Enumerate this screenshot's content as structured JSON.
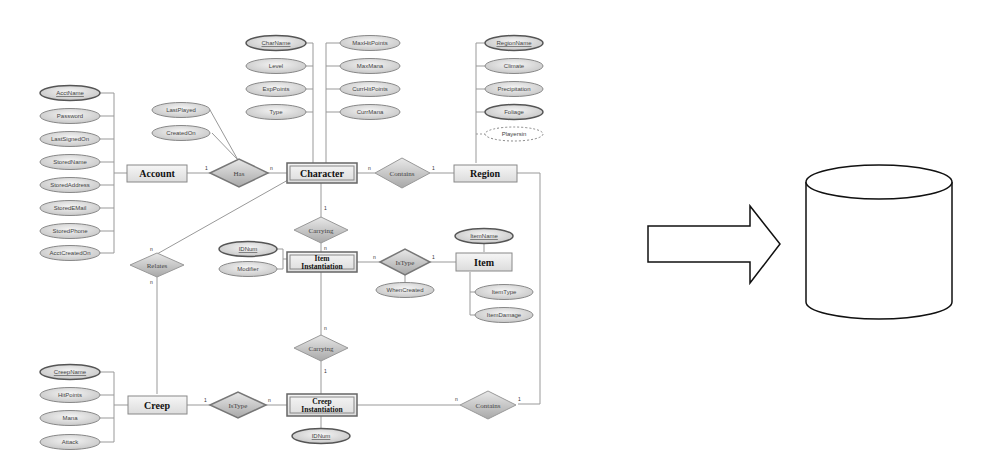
{
  "diagram": {
    "type": "ER diagram to database",
    "entities": [
      {
        "id": "account",
        "label": "Account",
        "attributes": [
          "AcctName",
          "Password",
          "LastSignedOn",
          "StoredName",
          "StoredAddress",
          "StoredEMail",
          "StoredPhone",
          "AcctCreatedOn"
        ],
        "key": "AcctName"
      },
      {
        "id": "character",
        "label": "Character",
        "attributes": [
          "CharName",
          "Level",
          "ExpPoints",
          "Type",
          "MaxHitPoints",
          "MaxMana",
          "CurrHitPoints",
          "CurrMana"
        ],
        "key": "CharName"
      },
      {
        "id": "region",
        "label": "Region",
        "attributes": [
          "RegionName",
          "Climate",
          "Precipitation",
          "Foliage",
          "Playersin"
        ],
        "key": "RegionName",
        "derived": "Playersin"
      },
      {
        "id": "item_instantiation",
        "label_line1": "Item",
        "label_line2": "Instantiation",
        "attributes": [
          "IDNum",
          "Modifier"
        ],
        "key": "IDNum",
        "weak": true
      },
      {
        "id": "item",
        "label": "Item",
        "attributes": [
          "ItemName",
          "ItemType",
          "ItemDamage"
        ],
        "key": "ItemName"
      },
      {
        "id": "creep",
        "label": "Creep",
        "attributes": [
          "CreepName",
          "HitPoints",
          "Mana",
          "Attack"
        ],
        "key": "CreepName"
      },
      {
        "id": "creep_instantiation",
        "label_line1": "Creep",
        "label_line2": "Instantiation",
        "attributes": [
          "IDNum"
        ],
        "key": "IDNum",
        "weak": true
      }
    ],
    "relationships": [
      {
        "id": "has",
        "label": "Has",
        "from": "Account",
        "to": "Character",
        "card_from": "1",
        "card_to": "n",
        "attributes": [
          "LastPlayed",
          "CreatedOn"
        ]
      },
      {
        "id": "contains_top",
        "label": "Contains",
        "from": "Character",
        "to": "Region",
        "card_from": "n",
        "card_to": "1"
      },
      {
        "id": "carrying_top",
        "label": "Carrying",
        "from": "Character",
        "to": "Item Instantiation",
        "card_from": "1",
        "card_to": "n"
      },
      {
        "id": "istype_item",
        "label": "IsType",
        "from": "Item Instantiation",
        "to": "Item",
        "card_from": "n",
        "card_to": "1",
        "attributes": [
          "WhenCreated"
        ]
      },
      {
        "id": "relates",
        "label": "Relates",
        "from": "Character",
        "to": "Creep",
        "card_from": "n",
        "card_to": "n"
      },
      {
        "id": "carrying_bottom",
        "label": "Carrying",
        "from": "Item Instantiation",
        "to": "Creep Instantiation",
        "card_from": "n",
        "card_to": "1"
      },
      {
        "id": "istype_creep",
        "label": "IsType",
        "from": "Creep",
        "to": "Creep Instantiation",
        "card_from": "1",
        "card_to": "n"
      },
      {
        "id": "contains_bottom",
        "label": "Contains",
        "from": "Creep Instantiation",
        "to": "Region",
        "card_from": "n",
        "card_to": "1"
      }
    ]
  },
  "arrow": {
    "direction": "right"
  },
  "database": {
    "shape": "cylinder"
  }
}
